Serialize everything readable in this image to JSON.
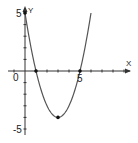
{
  "chart_data": {
    "type": "line",
    "title": "",
    "xlabel": "X",
    "ylabel": "Y",
    "function": "y = x^2 - 6x + 5",
    "x_range_plotted": [
      0,
      6
    ],
    "xlim": [
      -1.5,
      8.5
    ],
    "ylim": [
      -5.5,
      5.5
    ],
    "x_tick_labels": [
      "0",
      "5"
    ],
    "y_tick_labels": [
      "5",
      "-5"
    ],
    "series": [
      {
        "name": "parabola",
        "x": [
          0,
          0.5,
          1,
          1.5,
          2,
          2.5,
          3,
          3.5,
          4,
          4.5,
          5,
          5.5,
          6
        ],
        "y": [
          5,
          2.25,
          0,
          -1.75,
          -3,
          -3.75,
          -4,
          -3.75,
          -3,
          -1.75,
          0,
          2.25,
          5
        ]
      }
    ],
    "marked_points": [
      {
        "x": 0,
        "y": 5,
        "label": "y-intercept"
      },
      {
        "x": 1,
        "y": 0,
        "label": "root"
      },
      {
        "x": 5,
        "y": 0,
        "label": "root"
      },
      {
        "x": 3,
        "y": -4,
        "label": "vertex"
      }
    ],
    "grid": false,
    "legend": "none"
  },
  "labels": {
    "x_axis": "X",
    "y_axis": "Y",
    "origin": "0",
    "x_tick_5": "5",
    "y_tick_5": "5",
    "y_tick_neg5": "-5"
  },
  "colors": {
    "axis": "#333333",
    "curve": "#555555",
    "point": "#111111"
  }
}
